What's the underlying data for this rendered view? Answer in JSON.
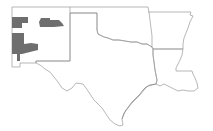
{
  "map": {
    "title": "",
    "background": "#ffffff",
    "state_outline_color": "#9a9a9a",
    "highlight_color": "#6e6e6e",
    "states": [
      {
        "name": "New Mexico"
      },
      {
        "name": "Texas"
      },
      {
        "name": "Oklahoma"
      },
      {
        "name": "Arkansas"
      },
      {
        "name": "Louisiana"
      }
    ],
    "highlighted_regions": [
      {
        "id": "nm-northwest",
        "state": "New Mexico"
      },
      {
        "id": "nm-north-central",
        "state": "New Mexico"
      },
      {
        "id": "nm-southwest",
        "state": "New Mexico"
      }
    ]
  }
}
